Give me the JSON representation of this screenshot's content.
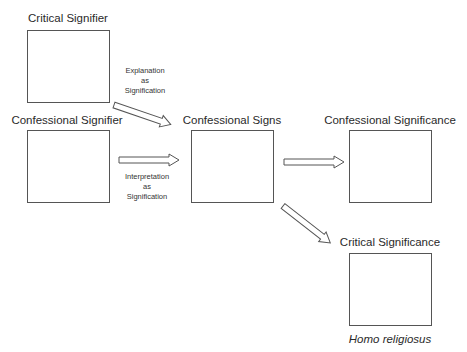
{
  "nodes": {
    "critical_signifier": {
      "label": "Critical Signifier"
    },
    "confessional_signifier": {
      "label": "Confessional Signifier"
    },
    "confessional_signs": {
      "label": "Confessional Signs"
    },
    "confessional_significance": {
      "label": "Confessional Significance"
    },
    "critical_significance": {
      "label": "Critical Significance",
      "caption": "Homo religiosus"
    }
  },
  "edges": {
    "explanation": {
      "line1": "Explanation",
      "line2": "as",
      "line3": "Signification"
    },
    "interpretation": {
      "line1": "Interpretation",
      "line2": "as",
      "line3": "Signification"
    }
  }
}
